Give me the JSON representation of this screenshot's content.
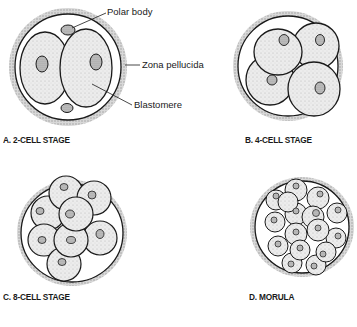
{
  "figure": {
    "panels": [
      {
        "id": "A",
        "caption": "A. 2-CELL STAGE",
        "cells": 2
      },
      {
        "id": "B",
        "caption": "B. 4-CELL STAGE",
        "cells": 4
      },
      {
        "id": "C",
        "caption": "C. 8-CELL STAGE",
        "cells": 8
      },
      {
        "id": "D",
        "caption": "D. MORULA",
        "cells": 16
      }
    ],
    "labels": {
      "polar_body": "Polar body",
      "zona_pellucida": "Zona pellucida",
      "blastomere": "Blastomere"
    },
    "colors": {
      "line": "#1a1a1a",
      "zona": "#bdbdbd",
      "cell": "#e4e4e4",
      "nucleus": "#b5b5b5"
    }
  }
}
